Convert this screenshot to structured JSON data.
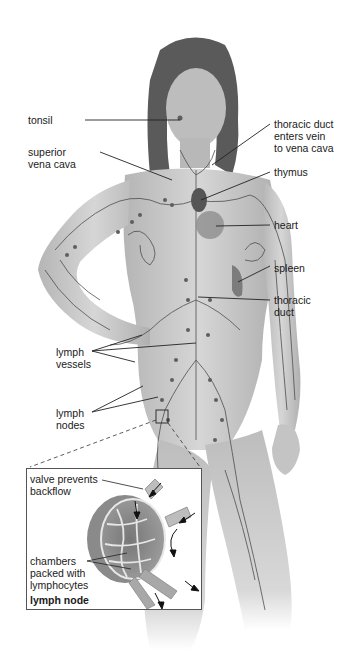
{
  "diagram": {
    "labels": {
      "tonsil": "tonsil",
      "superior_vena_cava": "superior\nvena cava",
      "thoracic_duct_enters_vein": "thoracic duct\nenters vein\nto vena cava",
      "thymus": "thymus",
      "heart": "heart",
      "spleen": "spleen",
      "thoracic_duct": "thoracic\nduct",
      "lymph_vessels": "lymph\nvessels",
      "lymph_nodes": "lymph\nnodes"
    },
    "inset": {
      "title": "lymph node",
      "labels": {
        "valve": "valve prevents\nbackflow",
        "chambers": "chambers\npacked with\nlymphocytes"
      }
    },
    "colors": {
      "skin": "#c9c9c9",
      "skin_shadow": "#9a9a9a",
      "vessel": "#4a4a4a",
      "node": "#5e5e5e",
      "hair": "#5a5a5a",
      "leader_line": "#222222",
      "inset_border": "#555555"
    }
  }
}
